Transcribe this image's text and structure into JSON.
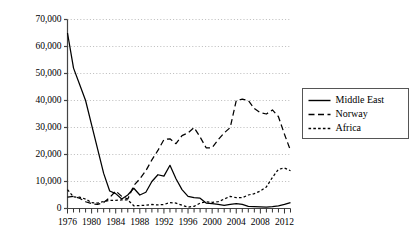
{
  "chart_data": {
    "type": "line",
    "title": "",
    "xlabel": "",
    "ylabel": "",
    "xlim": [
      1976,
      2013
    ],
    "ylim": [
      0,
      70000
    ],
    "grid": true,
    "y_ticks": [
      0,
      10000,
      20000,
      30000,
      40000,
      50000,
      60000,
      70000
    ],
    "y_tick_labels": [
      "0",
      "10,000",
      "20,000",
      "30,000",
      "40,000",
      "50,000",
      "60,000",
      "70,000"
    ],
    "x_ticks_major": [
      1976,
      1980,
      1984,
      1988,
      1992,
      1996,
      2000,
      2004,
      2008,
      2012
    ],
    "x_tick_labels": [
      "1976",
      "1980",
      "1984",
      "1988",
      "1992",
      "1996",
      "2000",
      "2004",
      "2008",
      "2012"
    ],
    "x_minor_tick_interval": 1,
    "legend_position": "right",
    "x": [
      1976,
      1977,
      1978,
      1979,
      1980,
      1981,
      1982,
      1983,
      1984,
      1985,
      1986,
      1987,
      1988,
      1989,
      1990,
      1991,
      1992,
      1993,
      1994,
      1995,
      1996,
      1997,
      1998,
      1999,
      2000,
      2001,
      2002,
      2003,
      2004,
      2005,
      2006,
      2007,
      2008,
      2009,
      2010,
      2011,
      2012,
      2013
    ],
    "series": [
      {
        "name": "Middle East",
        "style": "solid",
        "color": "#000000",
        "values": [
          65000,
          52000,
          46000,
          40000,
          31000,
          22000,
          13000,
          6500,
          5500,
          3500,
          5000,
          7500,
          5000,
          6000,
          10000,
          12500,
          12000,
          16000,
          11000,
          7000,
          4500,
          4000,
          3800,
          2000,
          1800,
          1500,
          1200,
          1500,
          1800,
          1500,
          800,
          700,
          600,
          500,
          700,
          1000,
          1500,
          2200
        ]
      },
      {
        "name": "Norway",
        "style": "longdash",
        "color": "#000000",
        "values": [
          4200,
          4500,
          3800,
          2500,
          1800,
          1500,
          2200,
          4000,
          6500,
          4500,
          3500,
          8500,
          11000,
          14000,
          18000,
          21500,
          25500,
          25800,
          24000,
          27000,
          28000,
          30000,
          26500,
          22500,
          22500,
          25500,
          28000,
          30000,
          40000,
          40500,
          40000,
          37000,
          35500,
          35000,
          36500,
          34000,
          27500,
          21500
        ]
      },
      {
        "name": "Africa",
        "style": "shortdash",
        "color": "#000000",
        "values": [
          7000,
          4300,
          4200,
          3500,
          2200,
          2000,
          2600,
          3000,
          3000,
          3200,
          3200,
          1000,
          1100,
          1200,
          1500,
          1300,
          1500,
          2200,
          2000,
          1200,
          500,
          800,
          2000,
          2500,
          2300,
          2500,
          3500,
          4500,
          4000,
          4000,
          5000,
          5500,
          6500,
          8000,
          11500,
          14500,
          15000,
          14000
        ]
      }
    ]
  },
  "legend": {
    "items": [
      {
        "label": "Middle East",
        "style": "solid"
      },
      {
        "label": "Norway",
        "style": "longdash"
      },
      {
        "label": "Africa",
        "style": "shortdash"
      }
    ]
  }
}
